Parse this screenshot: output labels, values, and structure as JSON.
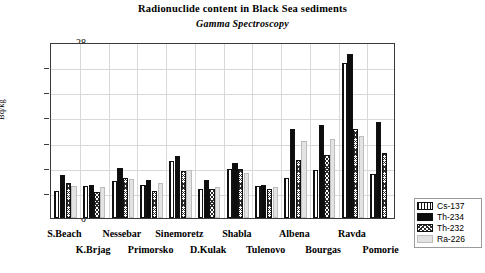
{
  "chart_data": {
    "type": "bar",
    "title": "Radionuclide content in Black Sea sediments",
    "subtitle": "Gamma Spectroscopy",
    "xlabel": "",
    "ylabel": "Bq/kg",
    "ylim": [
      0,
      28
    ],
    "yticks": [
      0,
      4,
      8,
      12,
      16,
      20,
      24,
      28
    ],
    "grid": true,
    "legend_position": "right-bottom-outside",
    "categories": [
      "S.Beach",
      "K.Brjag",
      "Nessebar",
      "Primorsko",
      "Sinemoretz",
      "D.Kulak",
      "Shabla",
      "Tulenovo",
      "Albena",
      "Bourgas",
      "Ravda",
      "Pomorie"
    ],
    "series": [
      {
        "name": "Cs-137",
        "pattern": "vertical-stripes",
        "color": "#ffffff",
        "values": [
          4.3,
          5.1,
          5.9,
          5.3,
          9.1,
          4.6,
          7.8,
          5.1,
          6.3,
          7.6,
          24.6,
          7.0
        ]
      },
      {
        "name": "Th-234",
        "pattern": "solid-black",
        "color": "#0d0d0d",
        "values": [
          6.8,
          5.2,
          8.0,
          6.0,
          9.8,
          6.0,
          8.8,
          5.3,
          14.1,
          14.8,
          26.1,
          15.2
        ]
      },
      {
        "name": "Th-232",
        "pattern": "cross-hatch",
        "color": "#ffffff",
        "values": [
          5.6,
          4.1,
          6.3,
          4.3,
          7.5,
          4.6,
          7.8,
          4.6,
          9.2,
          10.1,
          14.2,
          10.4
        ]
      },
      {
        "name": "Ra-226",
        "pattern": "light-gray",
        "color": "#e3e3e3",
        "values": [
          5.1,
          5.0,
          6.2,
          5.5,
          7.6,
          4.9,
          7.2,
          5.0,
          12.2,
          12.6,
          13.1,
          0.0
        ]
      }
    ]
  },
  "legend": {
    "items": [
      {
        "label": "Cs-137"
      },
      {
        "label": "Th-234"
      },
      {
        "label": "Th-232"
      },
      {
        "label": "Ra-226"
      }
    ]
  },
  "axis": {
    "y_label": "Bq/kg",
    "y_ticks": [
      "28",
      "24",
      "20",
      "16",
      "12",
      "8",
      "4",
      "0"
    ]
  },
  "x_labels_row_top": [
    "S.Beach",
    "Nessebar",
    "Sinemoretz",
    "Shabla",
    "Albena",
    "Ravda"
  ],
  "x_labels_row_bottom": [
    "K.Brjag",
    "Primorsko",
    "D.Kulak",
    "Tulenovo",
    "Bourgas",
    "Pomorie"
  ]
}
